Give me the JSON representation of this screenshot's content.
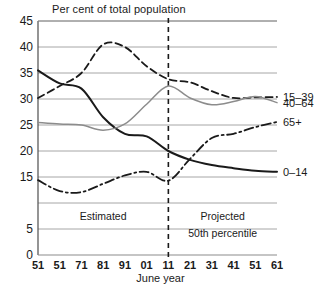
{
  "chart_data": {
    "type": "line",
    "title": "Per cent of total population",
    "xlabel": "June year",
    "ylabel": "",
    "ylim": [
      0,
      45
    ],
    "yticks": [
      "0",
      "5",
      "15",
      "20",
      "25",
      "30",
      "35",
      "40",
      "45"
    ],
    "ytick_values": [
      0,
      5,
      15,
      20,
      25,
      30,
      35,
      40,
      45
    ],
    "grid": true,
    "legend_position": "right-inline",
    "x": [
      1951,
      1961,
      1971,
      1981,
      1991,
      2001,
      2011,
      2021,
      2031,
      2041,
      2051,
      2061
    ],
    "xtick_labels": [
      "51",
      "51",
      "71",
      "81",
      "91",
      "01",
      "11",
      "21",
      "31",
      "41",
      "51",
      "61"
    ],
    "annotations": [
      {
        "text": "Estimated",
        "x": 1981,
        "y": 6.8
      },
      {
        "text": "Projected",
        "x": 2036,
        "y": 6.8
      },
      {
        "text": "50th percentile",
        "x": 2036,
        "y": 3.4
      }
    ],
    "divider": {
      "x": 2011,
      "style": "dashed",
      "label": "estimated-projected-divider"
    },
    "series": [
      {
        "name": "0–14",
        "label": "0–14",
        "style": "solid",
        "color": "#1a1a1a",
        "values": [
          35.5,
          33.0,
          32.0,
          26.5,
          23.3,
          22.8,
          20.0,
          18.3,
          17.3,
          16.7,
          16.2,
          16.0
        ]
      },
      {
        "name": "15–39",
        "label": "15–39",
        "style": "dashed",
        "color": "#1a1a1a",
        "values": [
          30.2,
          32.5,
          35.0,
          40.5,
          40.0,
          36.3,
          33.8,
          33.2,
          31.5,
          30.2,
          30.3,
          30.4
        ]
      },
      {
        "name": "40–64",
        "label": "40–64",
        "style": "solid-gray",
        "color": "#8c8c8c",
        "values": [
          25.5,
          25.2,
          25.0,
          24.0,
          25.2,
          29.0,
          32.5,
          30.2,
          28.9,
          29.5,
          30.5,
          29.3
        ]
      },
      {
        "name": "65+",
        "label": "65+",
        "style": "dash-dot",
        "color": "#1a1a1a",
        "values": [
          14.4,
          12.3,
          12.1,
          13.7,
          15.3,
          16.0,
          14.3,
          18.5,
          22.5,
          23.3,
          24.6,
          25.6
        ]
      }
    ]
  }
}
